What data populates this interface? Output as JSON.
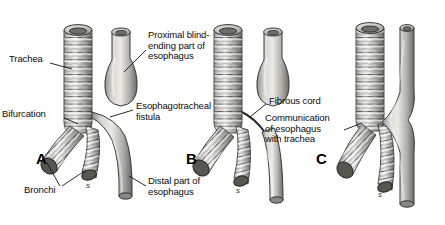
{
  "figure": {
    "background": "#ffffff",
    "ink": "#1a1a1a",
    "style": "grayscale anatomical engraving"
  },
  "panels": [
    {
      "letter": "A",
      "letter_x": 36,
      "letter_y": 150,
      "trachea_x": 78,
      "esophagus_x": 122,
      "type": "esophageal atresia with distal tracheoesophageal fistula",
      "signature": "s",
      "sig_x": 86,
      "sig_y": 181
    },
    {
      "letter": "B",
      "letter_x": 186,
      "letter_y": 150,
      "trachea_x": 228,
      "esophagus_x": 274,
      "type": "esophageal atresia with fibrous cord",
      "signature": "s",
      "sig_x": 236,
      "sig_y": 186
    },
    {
      "letter": "C",
      "letter_x": 316,
      "letter_y": 150,
      "trachea_x": 370,
      "esophagus_x": 409,
      "type": "H-type tracheoesophageal fistula",
      "signature": "s",
      "sig_x": 378,
      "sig_y": 190
    }
  ],
  "labels": [
    {
      "id": "trachea",
      "text": "Trachea",
      "x": 9,
      "y": 59,
      "align": "left",
      "width": 48
    },
    {
      "id": "bifurcation",
      "text": "Bifurcation",
      "x": 5,
      "y": 114,
      "align": "left",
      "width": 60
    },
    {
      "id": "bronchi",
      "text": "Bronchi",
      "x": 28,
      "y": 190,
      "align": "left",
      "width": 44
    },
    {
      "id": "proximal-pouch",
      "text": "Proximal blind-\nending part of\nesophagus",
      "x": 148,
      "y": 33,
      "align": "left",
      "width": 82
    },
    {
      "id": "fistula",
      "text": "Esophagotracheal\nfistula",
      "x": 135,
      "y": 105,
      "align": "left",
      "width": 90
    },
    {
      "id": "distal-eso",
      "text": "Distal part of\nesophagus",
      "x": 148,
      "y": 180,
      "align": "left",
      "width": 78
    },
    {
      "id": "fibrous-cord",
      "text": "Fibrous cord",
      "x": 268,
      "y": 100,
      "align": "left",
      "width": 66
    },
    {
      "id": "communication",
      "text": "Communication\nof esophagus\nwith trachea",
      "x": 265,
      "y": 117,
      "align": "left",
      "width": 80
    }
  ]
}
